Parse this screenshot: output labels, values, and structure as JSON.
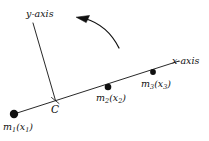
{
  "figure": {
    "type": "diagram",
    "background_color": "#ffffff",
    "stroke_color": "#101010",
    "width": 209,
    "height": 141
  },
  "axes": {
    "x_axis": {
      "label": "x-axis",
      "label_prefix": "x",
      "label_suffix": "-axis",
      "start": [
        14,
        114
      ],
      "end": [
        179,
        61
      ]
    },
    "y_axis": {
      "label": "y-axis",
      "label_prefix": "y",
      "label_suffix": "-axis",
      "start": [
        33,
        23
      ],
      "end": [
        55,
        100
      ]
    }
  },
  "origin": {
    "label": "C",
    "x": 55,
    "y": 100
  },
  "masses": [
    {
      "name": "m1",
      "mass_symbol": "m",
      "mass_index": "1",
      "coord_symbol": "x",
      "coord_index": "1",
      "label": "m1(x1)",
      "x": 14,
      "y": 114,
      "radius": 4.2
    },
    {
      "name": "m2",
      "mass_symbol": "m",
      "mass_index": "2",
      "coord_symbol": "x",
      "coord_index": "2",
      "label": "m2(x2)",
      "x": 108,
      "y": 87,
      "radius": 3.3
    },
    {
      "name": "m3",
      "mass_symbol": "m",
      "mass_index": "3",
      "coord_symbol": "x",
      "coord_index": "3",
      "label": "m3(x3)",
      "x": 153,
      "y": 72,
      "radius": 2.9
    }
  ],
  "rotation_arrow": {
    "name": "counterclockwise-rotation-arrow",
    "direction": "counterclockwise",
    "tail": [
      119,
      48
    ],
    "head": [
      77,
      18
    ]
  }
}
